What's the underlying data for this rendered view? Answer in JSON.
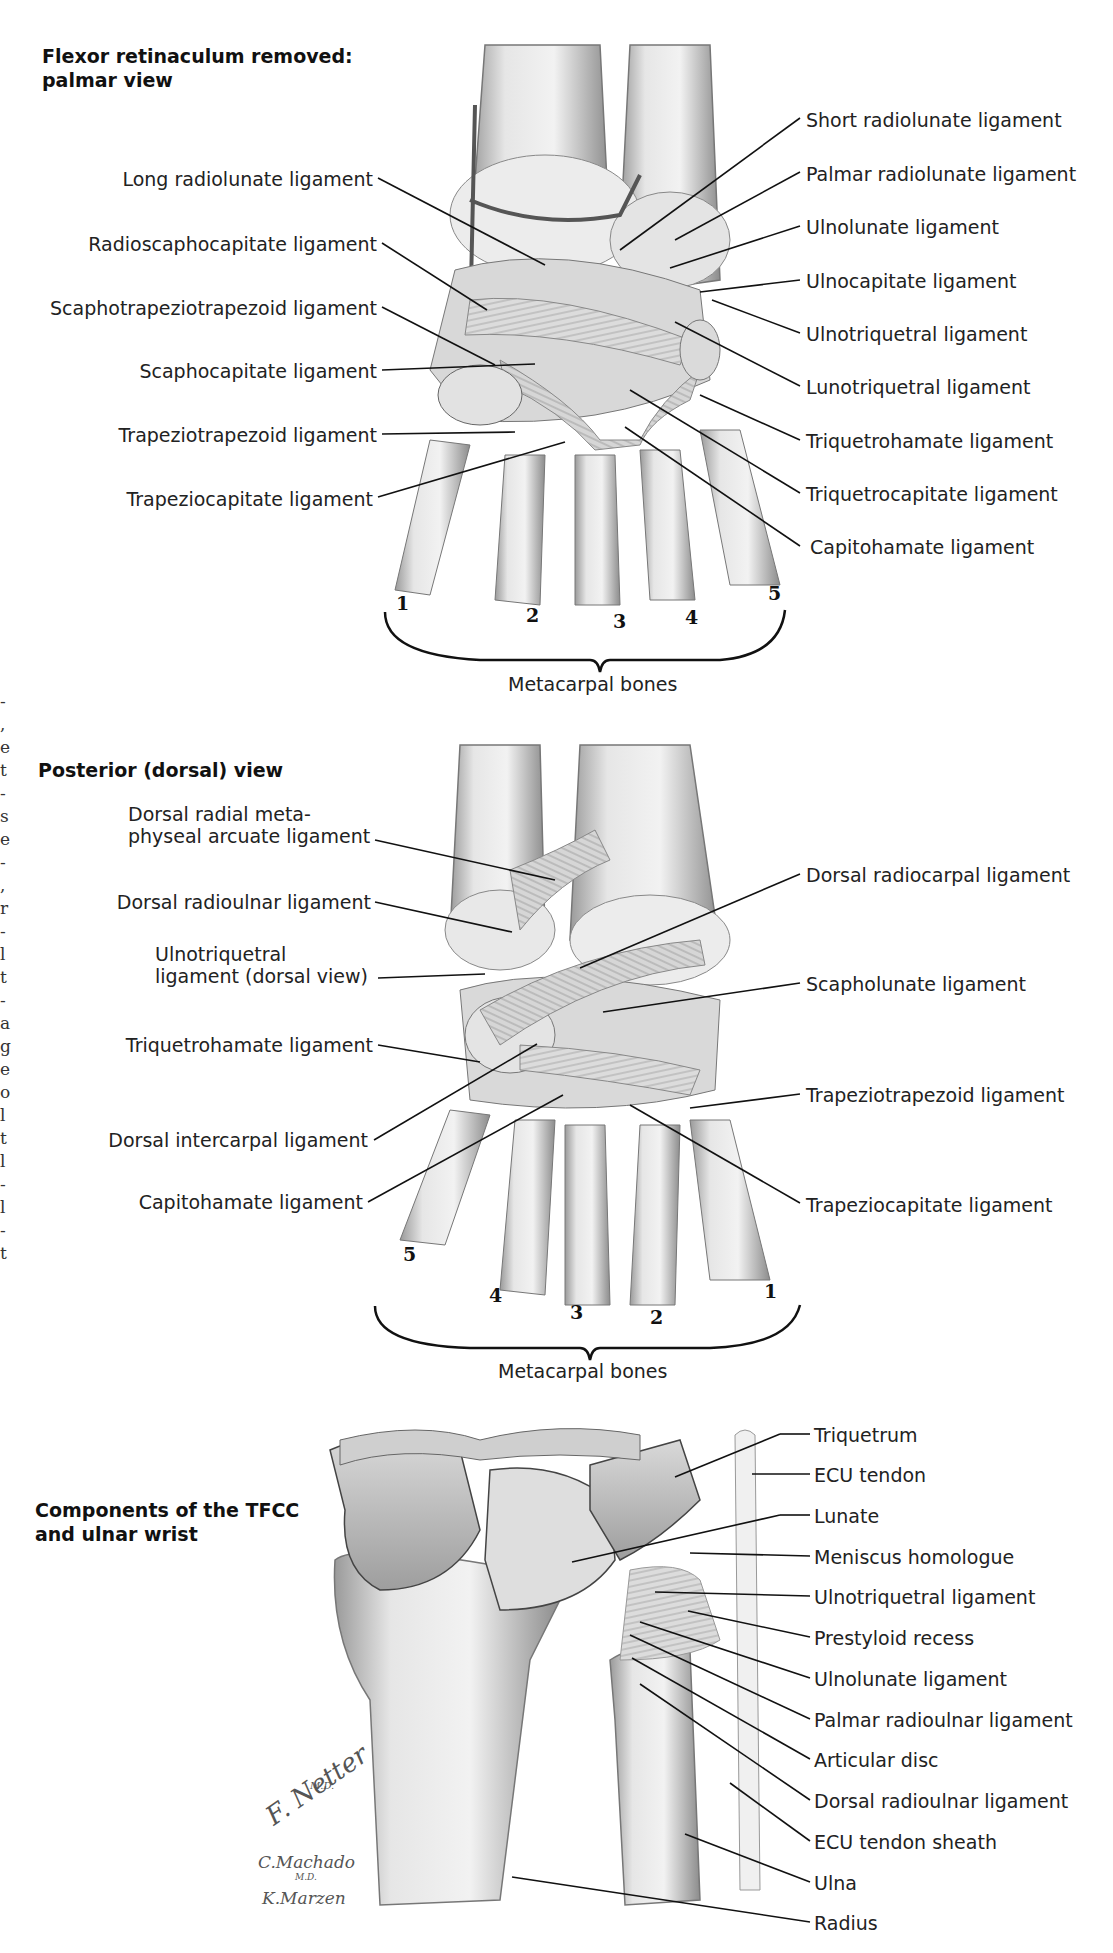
{
  "panels": {
    "palmar": {
      "title": "Flexor retinaculum removed:\npalmar view",
      "left_labels": [
        "Long radiolunate ligament",
        "Radioscaphocapitate ligament",
        "Scaphotrapeziotrapezoid ligament",
        "Scaphocapitate ligament",
        "Trapeziotrapezoid ligament",
        "Trapeziocapitate ligament"
      ],
      "right_labels": [
        "Short radiolunate ligament",
        "Palmar radiolunate ligament",
        "Ulnolunate ligament",
        "Ulnocapitate ligament",
        "Ulnotriquetral ligament",
        "Lunotriquetral ligament",
        "Triquetrohamate ligament",
        "Triquetrocapitate ligament",
        "Capitohamate ligament"
      ],
      "metacarpal_numbers": [
        "1",
        "2",
        "3",
        "4",
        "5"
      ],
      "caption": "Metacarpal bones"
    },
    "dorsal": {
      "title": "Posterior (dorsal) view",
      "left_labels": [
        "Dorsal radial meta-\nphyseal arcuate ligament",
        "Dorsal radioulnar ligament",
        "Ulnotriquetral\nligament (dorsal view)",
        "Triquetrohamate ligament",
        "Dorsal intercarpal ligament",
        "Capitohamate ligament"
      ],
      "right_labels": [
        "Dorsal radiocarpal ligament",
        "Scapholunate ligament",
        "Trapeziotrapezoid ligament",
        "Trapeziocapitate ligament"
      ],
      "metacarpal_numbers": [
        "5",
        "4",
        "3",
        "2",
        "1"
      ],
      "caption": "Metacarpal bones"
    },
    "tfcc": {
      "title": "Components of the TFCC\nand ulnar wrist",
      "right_labels": [
        "Triquetrum",
        "ECU tendon",
        "Lunate",
        "Meniscus homologue",
        "Ulnotriquetral ligament",
        "Prestyloid recess",
        "Ulnolunate ligament",
        "Palmar radioulnar ligament",
        "Articular disc",
        "Dorsal radioulnar ligament",
        "ECU tendon sheath",
        "Ulna",
        "Radius"
      ]
    }
  },
  "signatures": {
    "netter": "F. Netter",
    "netter_suffix": "M.D.",
    "machado": "C.Machado",
    "machado_suffix": "M.D.",
    "marzen": "K.Marzen"
  },
  "clipped_edge_text": "-\n,\ne\nt\n-\ns\ne\n-\n,\nr\n-\nl\nt\n-\na\ng\ne\no\nl\nt\nl\n-\nl\n-\nt"
}
